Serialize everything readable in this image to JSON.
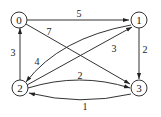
{
  "graph": {
    "type": "directed-weighted",
    "nodes": [
      {
        "id": "0",
        "label": "0"
      },
      {
        "id": "1",
        "label": "1"
      },
      {
        "id": "2",
        "label": "2"
      },
      {
        "id": "3",
        "label": "3"
      }
    ],
    "edges": [
      {
        "from": "0",
        "to": "1",
        "weight": "5"
      },
      {
        "from": "0",
        "to": "3",
        "weight": "7"
      },
      {
        "from": "2",
        "to": "0",
        "weight": "3"
      },
      {
        "from": "1",
        "to": "3",
        "weight": "2"
      },
      {
        "from": "1",
        "to": "2",
        "weight": "4"
      },
      {
        "from": "2",
        "to": "1",
        "weight": "3"
      },
      {
        "from": "2",
        "to": "3",
        "weight": "2"
      },
      {
        "from": "3",
        "to": "2",
        "weight": "1"
      }
    ]
  }
}
